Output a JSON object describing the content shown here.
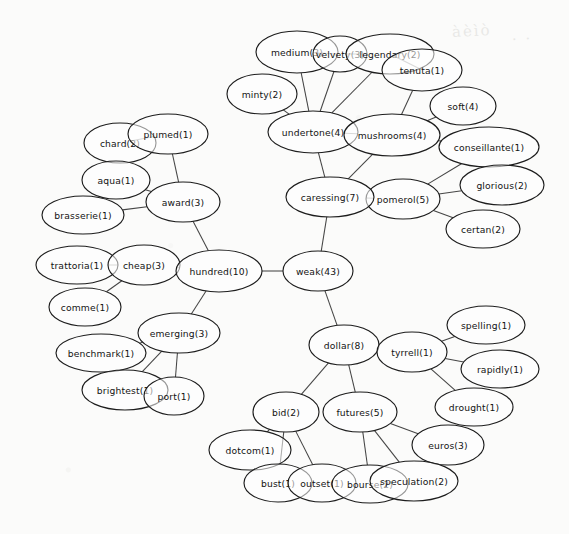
{
  "background_color": "#fbfbfa",
  "node_fill": "#ffffff",
  "node_stroke": "#1d1d1d",
  "edge_color": "#2b2b2b",
  "artifacts": [
    {
      "text": "àèìò",
      "x": 452,
      "y": 22
    },
    {
      "text": "· ·",
      "x": 512,
      "y": 30
    }
  ],
  "chart_data": {
    "type": "graph",
    "node_label_format": "term(count)",
    "legend": "",
    "xlabel": "",
    "ylabel": "",
    "grid": false,
    "nodes": [
      {
        "id": "medium",
        "term": "medium",
        "count": 3,
        "label": "medium(3)",
        "x": 297,
        "y": 52,
        "rx": 41,
        "ry": 21
      },
      {
        "id": "velvety",
        "term": "velvety",
        "count": 3,
        "label": "velvety(3)",
        "x": 340,
        "y": 54,
        "rx": 27,
        "ry": 18
      },
      {
        "id": "legendary",
        "term": "legendary",
        "count": 2,
        "label": "legendary(2)",
        "x": 390,
        "y": 54,
        "rx": 44,
        "ry": 20
      },
      {
        "id": "tenuta",
        "term": "tenuta",
        "count": 1,
        "label": "tenuta(1)",
        "x": 422,
        "y": 70,
        "rx": 40,
        "ry": 21
      },
      {
        "id": "minty",
        "term": "minty",
        "count": 2,
        "label": "minty(2)",
        "x": 262,
        "y": 94,
        "rx": 35,
        "ry": 20
      },
      {
        "id": "soft",
        "term": "soft",
        "count": 4,
        "label": "soft(4)",
        "x": 463,
        "y": 106,
        "rx": 33,
        "ry": 19
      },
      {
        "id": "undertone",
        "term": "undertone",
        "count": 4,
        "label": "undertone(4)",
        "x": 313,
        "y": 132,
        "rx": 45,
        "ry": 21
      },
      {
        "id": "mushrooms",
        "term": "mushrooms",
        "count": 4,
        "label": "mushrooms(4)",
        "x": 392,
        "y": 135,
        "rx": 48,
        "ry": 21
      },
      {
        "id": "conseillante",
        "term": "conseillante",
        "count": 1,
        "label": "conseillante(1)",
        "x": 489,
        "y": 147,
        "rx": 50,
        "ry": 20
      },
      {
        "id": "glorious",
        "term": "glorious",
        "count": 2,
        "label": "glorious(2)",
        "x": 502,
        "y": 185,
        "rx": 42,
        "ry": 20
      },
      {
        "id": "pomerol",
        "term": "pomerol",
        "count": 5,
        "label": "pomerol(5)",
        "x": 403,
        "y": 199,
        "rx": 37,
        "ry": 20
      },
      {
        "id": "caressing",
        "term": "caressing",
        "count": 7,
        "label": "caressing(7)",
        "x": 330,
        "y": 197,
        "rx": 44,
        "ry": 20
      },
      {
        "id": "certan",
        "term": "certan",
        "count": 2,
        "label": "certan(2)",
        "x": 483,
        "y": 229,
        "rx": 37,
        "ry": 19
      },
      {
        "id": "chard",
        "term": "chard",
        "count": 2,
        "label": "chard(2)",
        "x": 120,
        "y": 143,
        "rx": 36,
        "ry": 20
      },
      {
        "id": "plumed",
        "term": "plumed",
        "count": 1,
        "label": "plumed(1)",
        "x": 168,
        "y": 134,
        "rx": 40,
        "ry": 20
      },
      {
        "id": "aqua",
        "term": "aqua",
        "count": 1,
        "label": "aqua(1)",
        "x": 116,
        "y": 180,
        "rx": 34,
        "ry": 19
      },
      {
        "id": "award",
        "term": "award",
        "count": 3,
        "label": "award(3)",
        "x": 183,
        "y": 202,
        "rx": 37,
        "ry": 20
      },
      {
        "id": "brasserie",
        "term": "brasserie",
        "count": 1,
        "label": "brasserie(1)",
        "x": 83,
        "y": 215,
        "rx": 41,
        "ry": 19
      },
      {
        "id": "trattoria",
        "term": "trattoria",
        "count": 1,
        "label": "trattoria(1)",
        "x": 77,
        "y": 265,
        "rx": 41,
        "ry": 19
      },
      {
        "id": "cheap",
        "term": "cheap",
        "count": 3,
        "label": "cheap(3)",
        "x": 144,
        "y": 265,
        "rx": 36,
        "ry": 20
      },
      {
        "id": "hundred",
        "term": "hundred",
        "count": 10,
        "label": "hundred(10)",
        "x": 219,
        "y": 271,
        "rx": 43,
        "ry": 21
      },
      {
        "id": "weak",
        "term": "weak",
        "count": 43,
        "label": "weak(43)",
        "x": 318,
        "y": 271,
        "rx": 35,
        "ry": 20
      },
      {
        "id": "comme",
        "term": "comme",
        "count": 1,
        "label": "comme(1)",
        "x": 85,
        "y": 307,
        "rx": 36,
        "ry": 19
      },
      {
        "id": "emerging",
        "term": "emerging",
        "count": 3,
        "label": "emerging(3)",
        "x": 179,
        "y": 333,
        "rx": 41,
        "ry": 20
      },
      {
        "id": "benchmark",
        "term": "benchmark",
        "count": 1,
        "label": "benchmark(1)",
        "x": 101,
        "y": 353,
        "rx": 45,
        "ry": 19
      },
      {
        "id": "brightest",
        "term": "brightest",
        "count": 1,
        "label": "brightest(1)",
        "x": 125,
        "y": 390,
        "rx": 43,
        "ry": 20
      },
      {
        "id": "port",
        "term": "port",
        "count": 1,
        "label": "port(1)",
        "x": 174,
        "y": 396,
        "rx": 30,
        "ry": 19
      },
      {
        "id": "dollar",
        "term": "dollar",
        "count": 8,
        "label": "dollar(8)",
        "x": 344,
        "y": 345,
        "rx": 35,
        "ry": 20
      },
      {
        "id": "tyrrell",
        "term": "tyrrell",
        "count": 1,
        "label": "tyrrell(1)",
        "x": 412,
        "y": 352,
        "rx": 35,
        "ry": 20
      },
      {
        "id": "spelling",
        "term": "spelling",
        "count": 1,
        "label": "spelling(1)",
        "x": 486,
        "y": 325,
        "rx": 39,
        "ry": 19
      },
      {
        "id": "rapidly",
        "term": "rapidly",
        "count": 1,
        "label": "rapidly(1)",
        "x": 500,
        "y": 369,
        "rx": 39,
        "ry": 19
      },
      {
        "id": "drought",
        "term": "drought",
        "count": 1,
        "label": "drought(1)",
        "x": 474,
        "y": 407,
        "rx": 39,
        "ry": 19
      },
      {
        "id": "euros",
        "term": "euros",
        "count": 3,
        "label": "euros(3)",
        "x": 448,
        "y": 445,
        "rx": 36,
        "ry": 20
      },
      {
        "id": "bid",
        "term": "bid",
        "count": 2,
        "label": "bid(2)",
        "x": 286,
        "y": 412,
        "rx": 33,
        "ry": 20
      },
      {
        "id": "futures",
        "term": "futures",
        "count": 5,
        "label": "futures(5)",
        "x": 360,
        "y": 412,
        "rx": 37,
        "ry": 20
      },
      {
        "id": "dotcom",
        "term": "dotcom",
        "count": 1,
        "label": "dotcom(1)",
        "x": 250,
        "y": 450,
        "rx": 41,
        "ry": 20
      },
      {
        "id": "bust",
        "term": "bust",
        "count": 1,
        "label": "bust(1)",
        "x": 278,
        "y": 483,
        "rx": 34,
        "ry": 19
      },
      {
        "id": "outset",
        "term": "outset",
        "count": 1,
        "label": "outset(1)",
        "x": 322,
        "y": 483,
        "rx": 34,
        "ry": 19
      },
      {
        "id": "bourse",
        "term": "bourse",
        "count": 2,
        "label": "bourse(2)",
        "x": 370,
        "y": 484,
        "rx": 38,
        "ry": 19
      },
      {
        "id": "speculation",
        "term": "speculation",
        "count": 2,
        "label": "speculation(2)",
        "x": 414,
        "y": 481,
        "rx": 44,
        "ry": 20
      }
    ],
    "edges": [
      [
        "medium",
        "velvety"
      ],
      [
        "medium",
        "undertone"
      ],
      [
        "velvety",
        "legendary"
      ],
      [
        "velvety",
        "undertone"
      ],
      [
        "legendary",
        "tenuta"
      ],
      [
        "legendary",
        "undertone"
      ],
      [
        "tenuta",
        "mushrooms"
      ],
      [
        "minty",
        "undertone"
      ],
      [
        "soft",
        "mushrooms"
      ],
      [
        "undertone",
        "mushrooms"
      ],
      [
        "undertone",
        "caressing"
      ],
      [
        "mushrooms",
        "caressing"
      ],
      [
        "mushrooms",
        "conseillante"
      ],
      [
        "conseillante",
        "pomerol"
      ],
      [
        "glorious",
        "pomerol"
      ],
      [
        "certan",
        "pomerol"
      ],
      [
        "caressing",
        "pomerol"
      ],
      [
        "caressing",
        "weak"
      ],
      [
        "chard",
        "plumed"
      ],
      [
        "plumed",
        "award"
      ],
      [
        "aqua",
        "award"
      ],
      [
        "brasserie",
        "award"
      ],
      [
        "award",
        "hundred"
      ],
      [
        "trattoria",
        "cheap"
      ],
      [
        "cheap",
        "hundred"
      ],
      [
        "comme",
        "cheap"
      ],
      [
        "hundred",
        "weak"
      ],
      [
        "hundred",
        "emerging"
      ],
      [
        "emerging",
        "benchmark"
      ],
      [
        "emerging",
        "brightest"
      ],
      [
        "emerging",
        "port"
      ],
      [
        "weak",
        "dollar"
      ],
      [
        "dollar",
        "tyrrell"
      ],
      [
        "dollar",
        "bid"
      ],
      [
        "dollar",
        "futures"
      ],
      [
        "tyrrell",
        "spelling"
      ],
      [
        "tyrrell",
        "rapidly"
      ],
      [
        "tyrrell",
        "drought"
      ],
      [
        "bid",
        "dotcom"
      ],
      [
        "bid",
        "bust"
      ],
      [
        "bid",
        "outset"
      ],
      [
        "futures",
        "bourse"
      ],
      [
        "futures",
        "speculation"
      ],
      [
        "futures",
        "euros"
      ],
      [
        "speculation",
        "euros"
      ]
    ]
  }
}
